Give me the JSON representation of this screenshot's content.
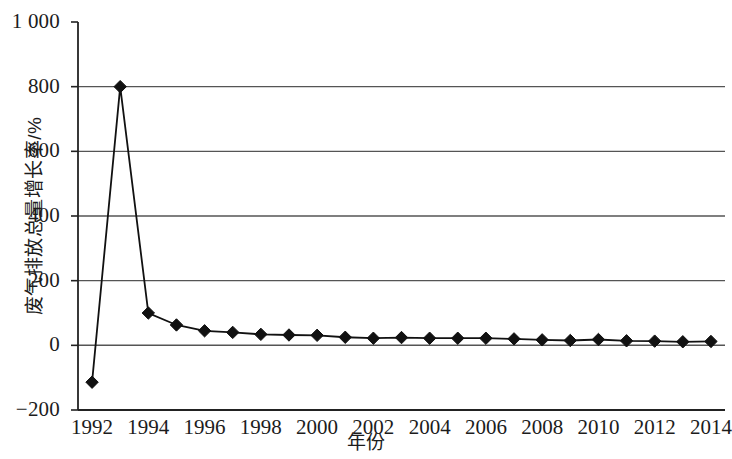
{
  "chart_data": {
    "type": "line",
    "title": "",
    "xlabel": "年份",
    "ylabel": "废气排放总量增长率/%",
    "xlim": [
      1991.5,
      2014.5
    ],
    "ylim": [
      -200,
      1000
    ],
    "grid": true,
    "legend": null,
    "marker": "diamond",
    "series_color": "#111111",
    "grid_color": "#555555",
    "axis_color": "#222222",
    "x": [
      1992,
      1993,
      1994,
      1995,
      1996,
      1997,
      1998,
      1999,
      2000,
      2001,
      2002,
      2003,
      2004,
      2005,
      2006,
      2007,
      2008,
      2009,
      2010,
      2011,
      2012,
      2013,
      2014
    ],
    "values": [
      -114,
      800,
      100,
      63,
      45,
      40,
      34,
      32,
      31,
      25,
      22,
      24,
      22,
      22,
      22,
      20,
      17,
      15,
      18,
      14,
      13,
      11,
      12
    ],
    "series": [
      {
        "name": "废气排放总量增长率",
        "values": [
          -114,
          800,
          100,
          63,
          45,
          40,
          34,
          32,
          31,
          25,
          22,
          24,
          22,
          22,
          22,
          20,
          17,
          15,
          18,
          14,
          13,
          11,
          12
        ]
      }
    ],
    "y_ticks": [
      -200,
      0,
      200,
      400,
      600,
      800,
      1000
    ],
    "y_tick_labels": [
      "−200",
      "0",
      "200",
      "400",
      "600",
      "800",
      "1 000"
    ],
    "x_ticks": [
      1992,
      1994,
      1996,
      1998,
      2000,
      2002,
      2004,
      2006,
      2008,
      2010,
      2012,
      2014
    ],
    "x_tick_labels": [
      "1992",
      "1994",
      "1996",
      "1998",
      "2000",
      "2002",
      "2004",
      "2006",
      "2008",
      "2010",
      "2012",
      "2014"
    ]
  }
}
